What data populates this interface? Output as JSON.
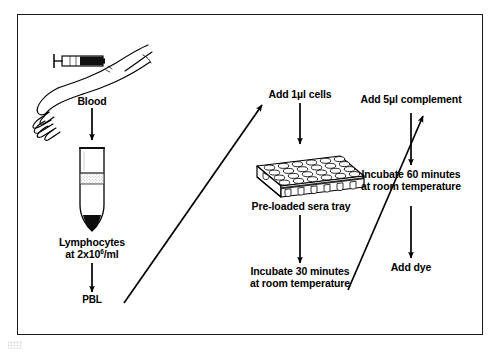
{
  "figure": {
    "frame_color": "#1a1a1a",
    "background_color": "#ffffff",
    "ink_color": "#000000"
  },
  "labels": {
    "blood": "Blood",
    "lymphocytes_line1": "Lymphocytes",
    "lymphocytes_line2_prefix": "at 2x10",
    "lymphocytes_line2_exponent": "6",
    "lymphocytes_line2_suffix": "/ml",
    "pbl": "PBL",
    "add_cells": "Add 1µl cells",
    "tray": "Pre-loaded sera tray",
    "incubate_30_line1": "Incubate 30 minutes",
    "incubate_30_line2": "at room temperature",
    "add_complement": "Add 5µl complement",
    "incubate_60_line1": "Incubate 60 minutes",
    "incubate_60_line2": "at room temperature",
    "add_dye": "Add dye"
  },
  "illustrations": {
    "arm_syringe": "arm-with-syringe-drawing-blood",
    "centrifuge_tube": "conical-centrifuge-tube-with-separated-layers",
    "sera_tray": "microtiter-tray-6x4-wells-isometric"
  },
  "flow": {
    "steps": [
      "Blood",
      "Lymphocytes at 2x10⁶/ml",
      "PBL",
      "Add 1µl cells",
      "Pre-loaded sera tray",
      "Incubate 30 minutes at room temperature",
      "Add 5µl complement",
      "Incubate 60 minutes at room temperature",
      "Add dye"
    ],
    "arrows": [
      "blood-to-tube",
      "tube-to-pbl",
      "pbl-to-add-cells",
      "add-cells-to-tray",
      "tray-to-incubate-30",
      "incubate-30-to-add-complement",
      "add-complement-to-incubate-60",
      "incubate-60-to-add-dye"
    ]
  }
}
